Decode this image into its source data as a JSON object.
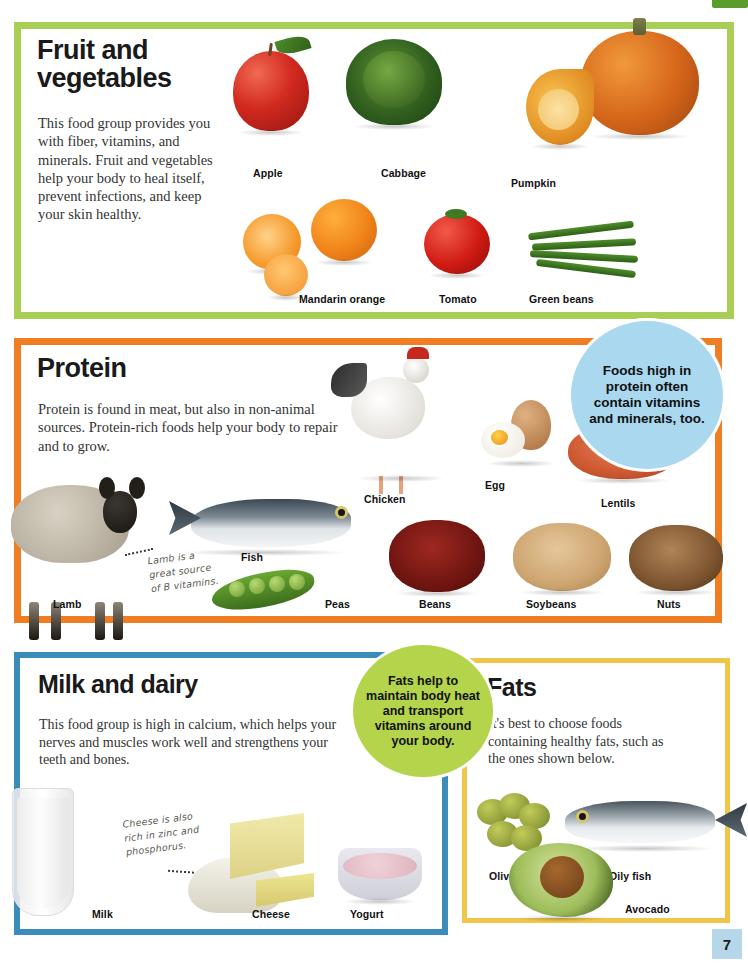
{
  "page": {
    "number": "7",
    "top_tab_color": "#5a9c2e"
  },
  "sections": [
    {
      "id": "fruit-vegetables",
      "title": "Fruit and vegetables",
      "body": "This food group provides you with fiber, vitamins, and minerals. Fruit and vegetables help your body to heal itself, prevent infections, and keep your skin healthy.",
      "border_color": "#a9ce55",
      "items": [
        "Apple",
        "Cabbage",
        "Pumpkin",
        "Mandarin orange",
        "Tomato",
        "Green beans"
      ]
    },
    {
      "id": "protein",
      "title": "Protein",
      "body": "Protein is found in meat, but also in non-animal sources. Protein-rich foods help your body to repair and to grow.",
      "border_color": "#f07d22",
      "items": [
        "Chicken",
        "Egg",
        "Lentils",
        "Lamb",
        "Fish",
        "Peas",
        "Beans",
        "Soybeans",
        "Nuts"
      ],
      "note": "Lamb is a great source of B vitamins."
    },
    {
      "id": "milk-and-dairy",
      "title": "Milk and dairy",
      "body": "This food group is high in calcium, which helps your nerves and muscles work well and strengthens your teeth and bones.",
      "border_color": "#3c8cba",
      "items": [
        "Milk",
        "Cheese",
        "Yogurt"
      ],
      "note": "Cheese is also rich in zinc and phosphorus."
    },
    {
      "id": "fats",
      "title": "Fats",
      "body": "It's best to choose foods containing healthy fats, such as the ones shown below.",
      "border_color": "#f0c64a",
      "items": [
        "Olives",
        "Oily fish",
        "Avocado"
      ]
    }
  ],
  "labels": {
    "apple": "Apple",
    "cabbage": "Cabbage",
    "pumpkin": "Pumpkin",
    "mandarin_orange": "Mandarin orange",
    "tomato": "Tomato",
    "green_beans": "Green beans",
    "chicken": "Chicken",
    "egg": "Egg",
    "lentils": "Lentils",
    "lamb": "Lamb",
    "fish": "Fish",
    "peas": "Peas",
    "beans": "Beans",
    "soybeans": "Soybeans",
    "nuts": "Nuts",
    "milk": "Milk",
    "cheese": "Cheese",
    "yogurt": "Yogurt",
    "olives": "Olives",
    "oily_fish": "Oily fish",
    "avocado": "Avocado"
  },
  "notes": {
    "lamb": "Lamb is a great source of B vitamins.",
    "cheese": "Cheese is also rich in zinc and phosphorus."
  },
  "bubbles": [
    {
      "id": "protein-bubble",
      "text": "Foods high in protein often contain vitamins and minerals, too.",
      "color": "#a9d8ef"
    },
    {
      "id": "fats-bubble",
      "text": "Fats help to maintain body heat and transport vitamins around your body.",
      "color": "#b3d44b"
    }
  ]
}
